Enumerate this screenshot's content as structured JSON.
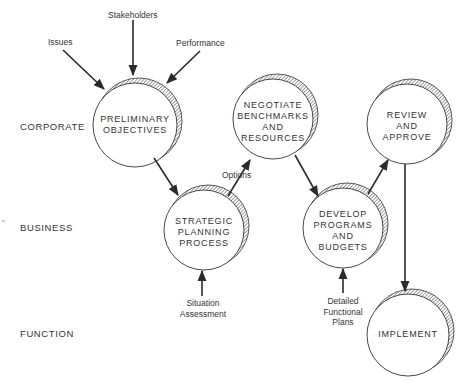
{
  "levels": {
    "corporate": "CORPORATE",
    "business": "BUSINESS",
    "function": "FUNCTION"
  },
  "nodes": {
    "preliminary": [
      "PRELIMINARY",
      "OBJECTIVES"
    ],
    "negotiate": [
      "NEGOTIATE",
      "BENCHMARKS",
      "AND",
      "RESOURCES"
    ],
    "review": [
      "REVIEW",
      "AND",
      "APPROVE"
    ],
    "strategic": [
      "STRATEGIC",
      "PLANNING",
      "PROCESS"
    ],
    "develop": [
      "DEVELOP",
      "PROGRAMS",
      "AND",
      "BUDGETS"
    ],
    "implement": [
      "IMPLEMENT"
    ]
  },
  "inputs": {
    "issues": "Issues",
    "stakeholders": "Stakeholders",
    "performance": "Performance",
    "options": "Options",
    "situation": [
      "Situation",
      "Assessment"
    ],
    "detailed": [
      "Detailed",
      "Functional",
      "Plans"
    ]
  },
  "colors": {
    "line": "#2a2a2a",
    "background": "#ffffff"
  }
}
